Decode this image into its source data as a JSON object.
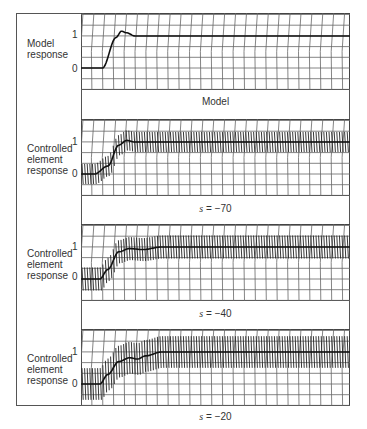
{
  "chart_data": [
    {
      "type": "line",
      "title": "Model",
      "ylabel": "Model response",
      "yticks": [
        "0",
        "1"
      ],
      "series": [
        {
          "name": "Model response",
          "x": [
            0,
            0.08,
            0.13,
            0.15,
            0.17,
            0.2,
            0.25,
            1.0
          ],
          "y": [
            0,
            0,
            0.95,
            1.15,
            1.1,
            1.0,
            1.0,
            1.0
          ]
        }
      ],
      "grid": true,
      "chatter": false
    },
    {
      "type": "line",
      "title": "s = −70",
      "ylabel": "Controlled element response",
      "yticks": [
        "0",
        "1"
      ],
      "series": [
        {
          "name": "Controlled element response",
          "x": [
            0,
            0.05,
            0.1,
            0.14,
            0.17,
            0.2,
            0.25,
            1.0
          ],
          "y": [
            0,
            0,
            0.25,
            0.9,
            1.05,
            1.0,
            1.0,
            1.0
          ]
        }
      ],
      "grid": true,
      "chatter": true,
      "chatter_amplitude": 0.35
    },
    {
      "type": "line",
      "title": "s = −40",
      "ylabel": "Controlled element response",
      "yticks": [
        "0",
        "1"
      ],
      "series": [
        {
          "name": "Controlled element response",
          "x": [
            0,
            0.07,
            0.1,
            0.14,
            0.18,
            0.23,
            0.3,
            1.0
          ],
          "y": [
            0,
            0,
            0.3,
            0.85,
            0.95,
            0.92,
            1.0,
            1.0
          ]
        }
      ],
      "grid": true,
      "chatter": true,
      "chatter_amplitude": 0.4
    },
    {
      "type": "line",
      "title": "s = −20",
      "ylabel": "Controlled element response",
      "yticks": [
        "0",
        "1"
      ],
      "series": [
        {
          "name": "Controlled element response",
          "x": [
            0,
            0.07,
            0.1,
            0.14,
            0.18,
            0.21,
            0.24,
            0.3,
            1.0
          ],
          "y": [
            0,
            0,
            0.3,
            0.7,
            0.82,
            0.78,
            0.88,
            1.0,
            1.0
          ]
        }
      ],
      "grid": true,
      "chatter": true,
      "chatter_amplitude": 0.55
    }
  ],
  "panels": [
    {
      "label_lines": [
        "Model",
        "response"
      ],
      "tick_1": "1",
      "tick_0": "0",
      "caption_prefix": "",
      "caption_value": "Model"
    },
    {
      "label_lines": [
        "Controlled",
        "element",
        "response"
      ],
      "tick_1": "1",
      "tick_0": "0",
      "caption_prefix": "s",
      "caption_value": " = −70"
    },
    {
      "label_lines": [
        "Controlled",
        "element",
        "response"
      ],
      "tick_1": "1",
      "tick_0": "0",
      "caption_prefix": "s",
      "caption_value": " = −40"
    },
    {
      "label_lines": [
        "Controlled",
        "element",
        "response"
      ],
      "tick_1": "1",
      "tick_0": "0",
      "caption_prefix": "s",
      "caption_value": " = −20"
    }
  ]
}
